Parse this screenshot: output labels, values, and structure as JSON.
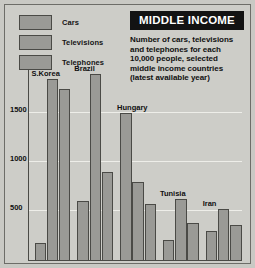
{
  "legend": {
    "items": [
      {
        "label": "Cars",
        "swatch_color": "#9a9a96"
      },
      {
        "label": "Televisions",
        "swatch_color": "#9a9a96"
      },
      {
        "label": "Telephones",
        "swatch_color": "#9a9a96"
      }
    ]
  },
  "title": {
    "banner": "MIDDLE INCOME",
    "banner_bg": "#131313",
    "banner_fg": "#ffffff",
    "description_lines": [
      "Number of cars, televisions",
      "and telephones for each",
      "10,000 people, selected",
      "middle income countries",
      "(latest available year)"
    ]
  },
  "chart_data": {
    "type": "bar",
    "title": "MIDDLE INCOME",
    "subtitle": "Number of cars, televisions and telephones for each 10,000 people, selected middle income countries (latest available year)",
    "xlabel": "",
    "ylabel": "",
    "ylim": [
      0,
      2000
    ],
    "yticks": [
      500,
      1000,
      1500
    ],
    "ytick_labels": [
      "500",
      "1000",
      "1500"
    ],
    "grid": true,
    "legend_position": "top-left",
    "categories": [
      "S.Korea",
      "Brazil",
      "Hungary",
      "Tunisia",
      "Iran"
    ],
    "series": [
      {
        "name": "Cars",
        "values": [
          170,
          600,
          1500,
          200,
          300
        ]
      },
      {
        "name": "Televisions",
        "values": [
          1850,
          1900,
          800,
          620,
          520
        ]
      },
      {
        "name": "Telephones",
        "values": [
          1750,
          900,
          570,
          380,
          360
        ]
      }
    ],
    "bar_color": "#9a9a96",
    "bar_border": "#4a4a46",
    "background": "#cdcdc8"
  }
}
